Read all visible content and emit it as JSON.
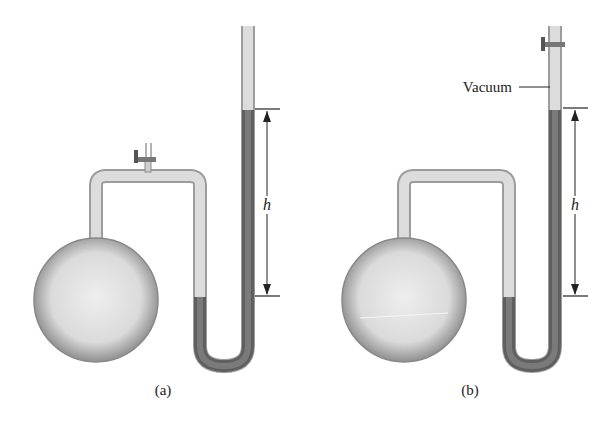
{
  "figure": {
    "panels": [
      {
        "id": "a",
        "caption": "(a)",
        "height_label": "h",
        "stopcock_position": "connecting tube (bulb side)"
      },
      {
        "id": "b",
        "caption": "(b)",
        "height_label": "h",
        "vacuum_label": "Vacuum",
        "stopcock_position": "top of closed arm"
      }
    ],
    "colors": {
      "glass": "#d9d9d9",
      "glass_edge": "#9a9a9a",
      "mercury": "#6e6e6e",
      "bulb": "#e2e2e2",
      "line": "#222222"
    }
  }
}
